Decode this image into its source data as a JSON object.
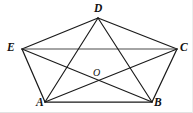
{
  "figure": {
    "background_color": "#ffffff",
    "line_color": "#1a1a1a",
    "label_color": "#111111",
    "width": 193,
    "height": 113,
    "vertices": [
      {
        "id": "D",
        "label": "D",
        "x": 98,
        "y": 18,
        "label_x": 94,
        "label_y": 3
      },
      {
        "id": "E",
        "label": "E",
        "x": 22,
        "y": 49,
        "label_x": 7,
        "label_y": 42
      },
      {
        "id": "C",
        "label": "C",
        "x": 177,
        "y": 49,
        "label_x": 180,
        "label_y": 42
      },
      {
        "id": "A",
        "label": "A",
        "x": 45,
        "y": 102,
        "label_x": 36,
        "label_y": 97
      },
      {
        "id": "B",
        "label": "B",
        "x": 152,
        "y": 102,
        "label_x": 154,
        "label_y": 97
      }
    ],
    "interior_points": [
      {
        "id": "O",
        "label": "O",
        "x": 98,
        "y": 80,
        "label_x": 93,
        "label_y": 68
      }
    ],
    "edges": [
      {
        "from": "D",
        "to": "E",
        "kind": "side"
      },
      {
        "from": "D",
        "to": "C",
        "kind": "side"
      },
      {
        "from": "E",
        "to": "A",
        "kind": "side"
      },
      {
        "from": "A",
        "to": "B",
        "kind": "side"
      },
      {
        "from": "B",
        "to": "C",
        "kind": "side"
      }
    ],
    "diagonals": [
      {
        "from": "E",
        "to": "C",
        "kind": "horizontal-diagonal"
      },
      {
        "from": "D",
        "to": "A",
        "kind": "diagonal"
      },
      {
        "from": "D",
        "to": "B",
        "kind": "diagonal"
      },
      {
        "from": "E",
        "to": "B",
        "kind": "diagonal"
      },
      {
        "from": "A",
        "to": "C",
        "kind": "diagonal"
      }
    ]
  }
}
